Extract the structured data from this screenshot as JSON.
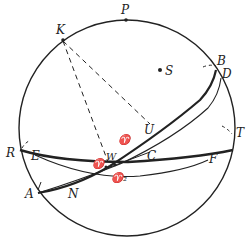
{
  "diagram": {
    "type": "celestial-sphere",
    "colors": {
      "ink": "#222222",
      "background": "#ffffff"
    },
    "points": {
      "P": {
        "label": "P",
        "x": 126,
        "y": 14
      },
      "K": {
        "label": "K",
        "x": 62,
        "y": 40
      },
      "S": {
        "label": "S",
        "x": 165,
        "y": 71
      },
      "B": {
        "label": "B",
        "x": 218,
        "y": 62
      },
      "D": {
        "label": "D",
        "x": 222,
        "y": 75
      },
      "R": {
        "label": "R",
        "x": 20,
        "y": 153
      },
      "T": {
        "label": "T",
        "x": 234,
        "y": 133
      },
      "U": {
        "label": "U",
        "x": 147,
        "y": 130
      },
      "C": {
        "label": "C",
        "x": 151,
        "y": 158
      },
      "E": {
        "label": "E",
        "x": 34,
        "y": 159
      },
      "F": {
        "label": "F",
        "x": 211,
        "y": 161
      },
      "W": {
        "label": "W",
        "x": 112,
        "y": 157
      },
      "A": {
        "label": "A",
        "x": 28,
        "y": 196
      },
      "N": {
        "label": "N",
        "x": 72,
        "y": 196
      },
      "aries1": {
        "label": "♈",
        "x": 123,
        "y": 141
      },
      "aries": {
        "label": "♈",
        "x": 97,
        "y": 160
      },
      "aries2": {
        "label": "♈₂",
        "x": 117,
        "y": 178
      }
    }
  }
}
